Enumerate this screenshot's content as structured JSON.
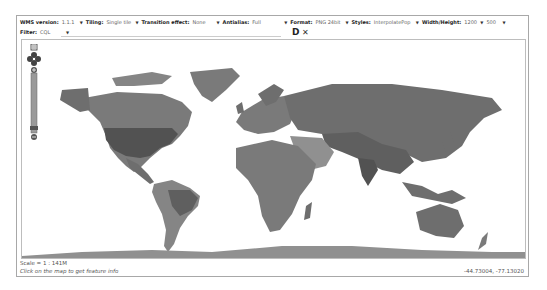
{
  "toolbar": {
    "wms_version": {
      "label": "WMS version:",
      "value": "1.1.1"
    },
    "tiling": {
      "label": "Tiling:",
      "value": "Single tile"
    },
    "transition": {
      "label": "Transition effect:",
      "value": "None"
    },
    "antialias": {
      "label": "Antialias:",
      "value": "Full"
    },
    "format": {
      "label": "Format:",
      "value": "PNG 24bit"
    },
    "styles": {
      "label": "Styles:",
      "value": "InterpolatePop"
    },
    "size": {
      "label": "Width/Height:",
      "width": "1200",
      "height": "500"
    },
    "filter": {
      "label": "Filter:",
      "value": "CQL",
      "input_value": ""
    },
    "apply_icon": "D",
    "clear_icon": "✕"
  },
  "map": {
    "land_colors": [
      "#6e6e6e",
      "#7a7a7a",
      "#858585",
      "#5f5f5f",
      "#909090",
      "#525252"
    ],
    "water_color": "#ffffff"
  },
  "status": {
    "scale": "Scale = 1 : 141M",
    "info": "Click on the map to get feature info",
    "coords": "-44.73004, -77.13020"
  }
}
